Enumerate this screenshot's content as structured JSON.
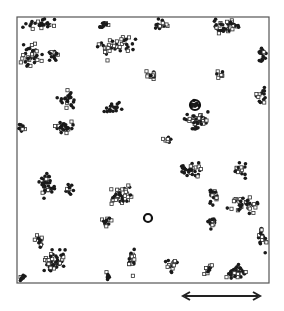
{
  "chart_data": {
    "type": "scatter",
    "title": "",
    "xlabel": "",
    "ylabel": "",
    "frame": {
      "x": 17,
      "y": 17,
      "width": 252,
      "height": 266
    },
    "scale_bar": {
      "x1": 183,
      "x2": 260,
      "y": 296,
      "label": ""
    },
    "legend": [],
    "series": [
      {
        "name": "filled",
        "marker": "dot",
        "color": "#1a1a1a"
      },
      {
        "name": "open",
        "marker": "square",
        "color": "#333333"
      }
    ],
    "clusters": [
      {
        "cx": 40,
        "cy": 24,
        "rx": 22,
        "ry": 7,
        "n": 26,
        "open": 0.3
      },
      {
        "cx": 32,
        "cy": 55,
        "rx": 14,
        "ry": 16,
        "n": 36,
        "open": 0.45
      },
      {
        "cx": 55,
        "cy": 55,
        "rx": 8,
        "ry": 8,
        "n": 14,
        "open": 0.4
      },
      {
        "cx": 103,
        "cy": 24,
        "rx": 10,
        "ry": 5,
        "n": 12,
        "open": 0.2
      },
      {
        "cx": 118,
        "cy": 45,
        "rx": 22,
        "ry": 10,
        "n": 34,
        "open": 0.4
      },
      {
        "cx": 107,
        "cy": 52,
        "rx": 4,
        "ry": 10,
        "n": 8,
        "open": 0.8
      },
      {
        "cx": 160,
        "cy": 25,
        "rx": 14,
        "ry": 8,
        "n": 16,
        "open": 0.5
      },
      {
        "cx": 228,
        "cy": 27,
        "rx": 22,
        "ry": 9,
        "n": 40,
        "open": 0.4
      },
      {
        "cx": 262,
        "cy": 55,
        "rx": 6,
        "ry": 14,
        "n": 14,
        "open": 0.3
      },
      {
        "cx": 68,
        "cy": 100,
        "rx": 12,
        "ry": 14,
        "n": 22,
        "open": 0.2
      },
      {
        "cx": 64,
        "cy": 127,
        "rx": 14,
        "ry": 7,
        "n": 24,
        "open": 0.2
      },
      {
        "cx": 22,
        "cy": 128,
        "rx": 5,
        "ry": 6,
        "n": 12,
        "open": 0.3
      },
      {
        "cx": 112,
        "cy": 109,
        "rx": 12,
        "ry": 10,
        "n": 18,
        "open": 0.1
      },
      {
        "cx": 195,
        "cy": 105,
        "rx": 6,
        "ry": 6,
        "n": 12,
        "open": 0.1
      },
      {
        "cx": 195,
        "cy": 122,
        "rx": 18,
        "ry": 12,
        "n": 40,
        "open": 0.35
      },
      {
        "cx": 165,
        "cy": 140,
        "rx": 8,
        "ry": 4,
        "n": 8,
        "open": 0.3
      },
      {
        "cx": 260,
        "cy": 95,
        "rx": 8,
        "ry": 14,
        "n": 14,
        "open": 0.5
      },
      {
        "cx": 150,
        "cy": 75,
        "rx": 8,
        "ry": 8,
        "n": 12,
        "open": 0.5
      },
      {
        "cx": 220,
        "cy": 73,
        "rx": 8,
        "ry": 6,
        "n": 8,
        "open": 0.7
      },
      {
        "cx": 45,
        "cy": 183,
        "rx": 12,
        "ry": 22,
        "n": 34,
        "open": 0.1
      },
      {
        "cx": 70,
        "cy": 190,
        "rx": 8,
        "ry": 8,
        "n": 10,
        "open": 0.2
      },
      {
        "cx": 120,
        "cy": 195,
        "rx": 16,
        "ry": 14,
        "n": 40,
        "open": 0.4
      },
      {
        "cx": 107,
        "cy": 222,
        "rx": 8,
        "ry": 6,
        "n": 12,
        "open": 0.5
      },
      {
        "cx": 190,
        "cy": 170,
        "rx": 14,
        "ry": 10,
        "n": 34,
        "open": 0.2
      },
      {
        "cx": 213,
        "cy": 195,
        "rx": 7,
        "ry": 12,
        "n": 20,
        "open": 0.3
      },
      {
        "cx": 212,
        "cy": 222,
        "rx": 7,
        "ry": 8,
        "n": 14,
        "open": 0.2
      },
      {
        "cx": 245,
        "cy": 205,
        "rx": 20,
        "ry": 10,
        "n": 36,
        "open": 0.45
      },
      {
        "cx": 240,
        "cy": 170,
        "rx": 8,
        "ry": 12,
        "n": 14,
        "open": 0.4
      },
      {
        "cx": 262,
        "cy": 240,
        "rx": 7,
        "ry": 14,
        "n": 16,
        "open": 0.6
      },
      {
        "cx": 40,
        "cy": 240,
        "rx": 8,
        "ry": 10,
        "n": 14,
        "open": 0.3
      },
      {
        "cx": 55,
        "cy": 262,
        "rx": 16,
        "ry": 14,
        "n": 46,
        "open": 0.45
      },
      {
        "cx": 22,
        "cy": 278,
        "rx": 5,
        "ry": 4,
        "n": 8,
        "open": 0.1
      },
      {
        "cx": 108,
        "cy": 276,
        "rx": 5,
        "ry": 6,
        "n": 8,
        "open": 0.2
      },
      {
        "cx": 132,
        "cy": 262,
        "rx": 5,
        "ry": 16,
        "n": 16,
        "open": 0.8
      },
      {
        "cx": 170,
        "cy": 265,
        "rx": 10,
        "ry": 10,
        "n": 16,
        "open": 0.5
      },
      {
        "cx": 208,
        "cy": 270,
        "rx": 6,
        "ry": 10,
        "n": 12,
        "open": 0.5
      },
      {
        "cx": 237,
        "cy": 272,
        "rx": 12,
        "ry": 8,
        "n": 36,
        "open": 0.2
      }
    ],
    "rings": [
      {
        "cx": 148,
        "cy": 218,
        "r": 4
      },
      {
        "cx": 195,
        "cy": 105,
        "r": 5
      }
    ]
  }
}
